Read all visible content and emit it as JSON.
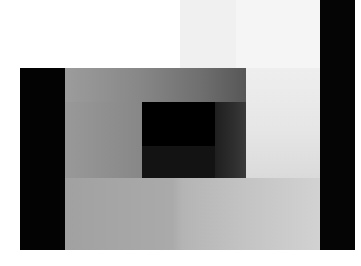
{
  "canvas": {
    "width": 361,
    "height": 266,
    "background": "#ffffff"
  },
  "palette": {
    "white": "#ffffff",
    "near_black": "#030303",
    "mid_gray": "#9a9a9a",
    "light_gray": "#e9e9e9"
  },
  "rects": [
    {
      "name": "top-light-band-left",
      "x": 180,
      "y": 0,
      "w": 56,
      "h": 68,
      "fill": "#f0f0f0"
    },
    {
      "name": "top-light-band-right",
      "x": 236,
      "y": 0,
      "w": 84,
      "h": 68,
      "fill": "#f5f5f5"
    },
    {
      "name": "field-upper-band",
      "x": 65,
      "y": 68,
      "w": 181,
      "h": 34,
      "gradient": {
        "dir": "to right",
        "stops": [
          {
            "color": "#9c9c9c",
            "at": 0
          },
          {
            "color": "#888888",
            "at": 40
          },
          {
            "color": "#6f6f6f",
            "at": 75
          },
          {
            "color": "#575757",
            "at": 100
          }
        ]
      }
    },
    {
      "name": "field-right-column",
      "x": 246,
      "y": 68,
      "w": 74,
      "h": 110,
      "gradient": {
        "dir": "to bottom",
        "stops": [
          {
            "color": "#eeeeee",
            "at": 0
          },
          {
            "color": "#e6e6e6",
            "at": 55
          },
          {
            "color": "#dadada",
            "at": 100
          }
        ]
      }
    },
    {
      "name": "field-left-column",
      "x": 65,
      "y": 102,
      "w": 77,
      "h": 76,
      "gradient": {
        "dir": "to right",
        "stops": [
          {
            "color": "#999999",
            "at": 0
          },
          {
            "color": "#878787",
            "at": 100
          }
        ]
      }
    },
    {
      "name": "inner-black-core",
      "x": 142,
      "y": 102,
      "w": 73,
      "h": 44,
      "fill": "#000000"
    },
    {
      "name": "inner-dark-lower",
      "x": 142,
      "y": 146,
      "w": 73,
      "h": 32,
      "fill": "#131313"
    },
    {
      "name": "inner-dark-right",
      "x": 215,
      "y": 102,
      "w": 31,
      "h": 76,
      "gradient": {
        "dir": "to right",
        "stops": [
          {
            "color": "#1f1f1f",
            "at": 0
          },
          {
            "color": "#2e2e2e",
            "at": 60
          },
          {
            "color": "#3a3a3a",
            "at": 100
          }
        ]
      }
    },
    {
      "name": "field-lower-band",
      "x": 65,
      "y": 178,
      "w": 255,
      "h": 72,
      "gradient": {
        "dir": "to right",
        "stops": [
          {
            "color": "#a1a1a1",
            "at": 0
          },
          {
            "color": "#aaaaaa",
            "at": 42
          },
          {
            "color": "#b4b4b4",
            "at": 46
          },
          {
            "color": "#c3c3c3",
            "at": 70
          },
          {
            "color": "#d2d2d2",
            "at": 100
          }
        ]
      }
    },
    {
      "name": "left-black-bar",
      "x": 20,
      "y": 68,
      "w": 45,
      "h": 182,
      "fill": "#030303"
    },
    {
      "name": "right-black-bar",
      "x": 320,
      "y": 0,
      "w": 35,
      "h": 250,
      "fill": "#050505"
    }
  ]
}
